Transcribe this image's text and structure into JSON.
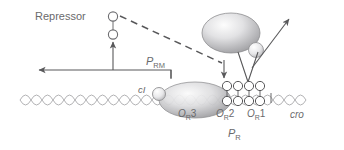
{
  "figure": {
    "labels": {
      "repressor": "Repressor",
      "prm_italic": "P",
      "prm_sub": "RM",
      "pr_italic": "P",
      "pr_sub": "R",
      "ci": "cI",
      "or3_o": "O",
      "or3_sub": "R",
      "or3_num": "3",
      "or2_o": "O",
      "or2_sub": "R",
      "or2_num": "2",
      "or1_o": "O",
      "or1_sub": "R",
      "or1_num": "1",
      "cro": "cro"
    },
    "colors": {
      "line": "#58585a",
      "text": "#6a6a6c",
      "dna": "#a9a9ac",
      "protein_light": "#f2f2f2",
      "protein_mid": "#b9b9bc",
      "protein_dark": "#8e8e91",
      "circle_fill": "#ffffff",
      "circle_stroke": "#6e6e71"
    },
    "elements": [
      {
        "name": "free-repressor-dimer",
        "type": "two-circles"
      },
      {
        "name": "rna-polymerase",
        "type": "large-ellipse"
      },
      {
        "name": "ci-tetramer-at-or3",
        "type": "large-ellipse"
      },
      {
        "name": "bound-repressor-dimers",
        "type": "circle-stack",
        "count": 8
      },
      {
        "name": "prm-transcript-arrow",
        "type": "left-arrow"
      },
      {
        "name": "repressor-production-arrow",
        "type": "up-arrow"
      },
      {
        "name": "cooperativity-dashed-line",
        "type": "dashed"
      },
      {
        "name": "polymerase-binding-arrow",
        "type": "down-arrow"
      },
      {
        "name": "repression-vee",
        "type": "vee-with-arrow"
      }
    ]
  }
}
